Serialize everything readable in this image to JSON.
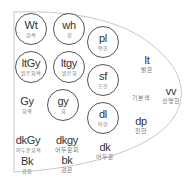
{
  "diagram": {
    "outline_color": "#c8c8c8",
    "circle_border_color": "#555555",
    "circled_tones": [
      {
        "id": "Wt",
        "abbr": "Wt",
        "label": "흰색",
        "x": 31,
        "y": 29
      },
      {
        "id": "wh",
        "abbr": "wh",
        "label": "흰",
        "x": 69,
        "y": 29
      },
      {
        "id": "ltGy",
        "abbr": "ltGy",
        "label": "밝은회색",
        "x": 31,
        "y": 67
      },
      {
        "id": "ltgy",
        "abbr": "ltgy",
        "label": "밝은회",
        "x": 69,
        "y": 67
      },
      {
        "id": "gy",
        "abbr": "gy",
        "label": "회",
        "x": 63,
        "y": 105
      },
      {
        "id": "pl",
        "abbr": "pl",
        "label": "연한",
        "x": 103,
        "y": 42
      },
      {
        "id": "sf",
        "abbr": "sf",
        "label": "흐린",
        "x": 103,
        "y": 80
      },
      {
        "id": "dl",
        "abbr": "dl",
        "label": "탁한",
        "x": 103,
        "y": 118
      }
    ],
    "plain_tones": [
      {
        "id": "Gy",
        "abbr": "Gy",
        "label": "회색",
        "x": 27,
        "y": 105
      },
      {
        "id": "dkGy",
        "abbr": "dkGy",
        "label": "어두운회색",
        "x": 28,
        "y": 144
      },
      {
        "id": "dkgy",
        "abbr": "dkgy",
        "label": "어두운회",
        "x": 67,
        "y": 144
      },
      {
        "id": "Bk",
        "abbr": "Bk",
        "label": "검정",
        "x": 27,
        "y": 165
      },
      {
        "id": "bk",
        "abbr": "bk",
        "label": "검은",
        "x": 67,
        "y": 164
      },
      {
        "id": "dk",
        "abbr": "dk",
        "label": "어두운",
        "x": 105,
        "y": 151
      },
      {
        "id": "lt",
        "abbr": "lt",
        "label": "밝은",
        "x": 147,
        "y": 64
      },
      {
        "id": "vv",
        "abbr": "vv",
        "label": "선명한",
        "x": 171,
        "y": 95
      },
      {
        "id": "dp",
        "abbr": "dp",
        "label": "진한",
        "x": 141,
        "y": 125
      }
    ],
    "region_labels": [
      {
        "id": "basic",
        "label": "기본색",
        "x": 141,
        "y": 97
      }
    ]
  }
}
